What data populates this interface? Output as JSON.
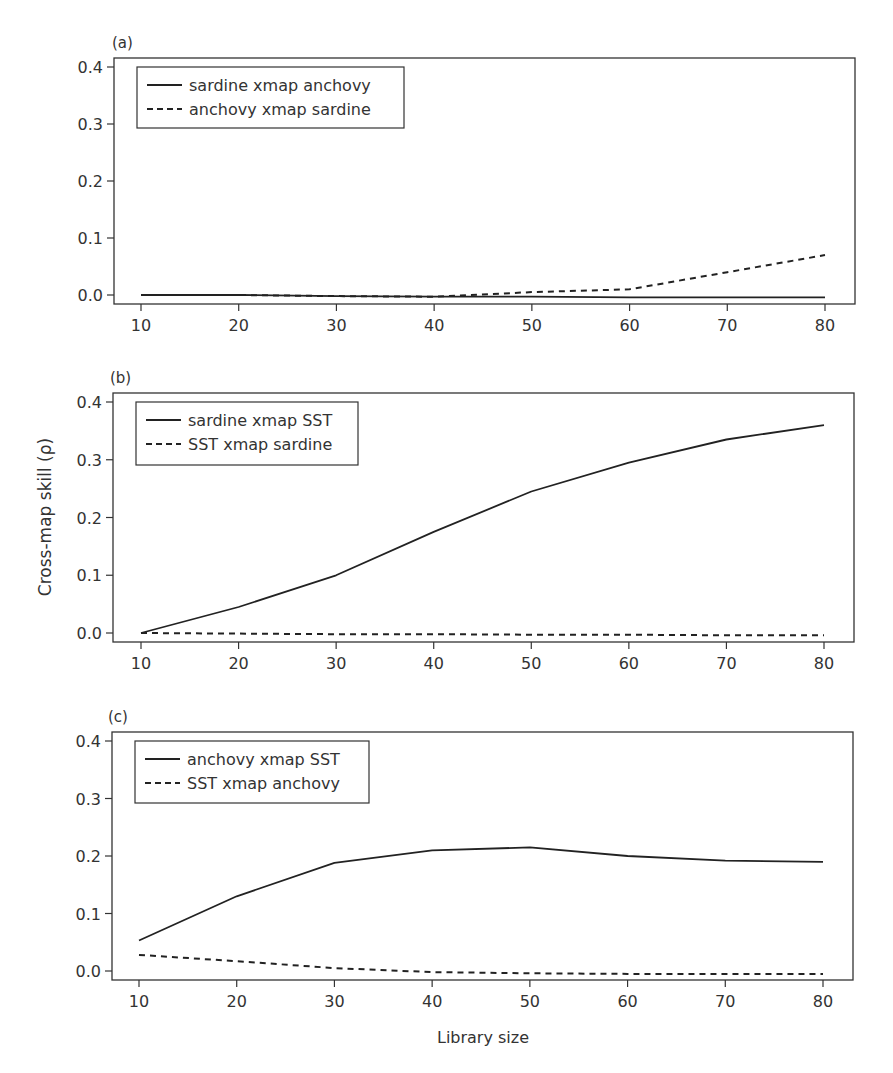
{
  "figure": {
    "ylabel": "Cross-map skill (ρ)",
    "xlabel": "Library size"
  },
  "chart_data": [
    {
      "type": "line",
      "panel_label": "(a)",
      "xlabel": "",
      "ylabel": "",
      "xlim": [
        10,
        80
      ],
      "ylim": [
        0.0,
        0.4
      ],
      "x_ticks": [
        "10",
        "20",
        "30",
        "40",
        "50",
        "60",
        "70",
        "80"
      ],
      "y_ticks": [
        "0.0",
        "0.1",
        "0.2",
        "0.3",
        "0.4"
      ],
      "grid": false,
      "legend_position": "upper-left",
      "x": [
        10,
        20,
        30,
        40,
        50,
        60,
        70,
        80
      ],
      "series": [
        {
          "name": "sardine xmap anchovy",
          "style": "solid",
          "values": [
            0.0,
            0.0,
            -0.002,
            -0.003,
            -0.003,
            -0.004,
            -0.004,
            -0.004
          ]
        },
        {
          "name": "anchovy xmap sardine",
          "style": "dashed",
          "values": [
            0.0,
            0.0,
            -0.002,
            -0.003,
            0.005,
            0.01,
            0.04,
            0.07
          ]
        }
      ]
    },
    {
      "type": "line",
      "panel_label": "(b)",
      "xlabel": "",
      "ylabel": "Cross-map skill (ρ)",
      "xlim": [
        10,
        80
      ],
      "ylim": [
        0.0,
        0.4
      ],
      "x_ticks": [
        "10",
        "20",
        "30",
        "40",
        "50",
        "60",
        "70",
        "80"
      ],
      "y_ticks": [
        "0.0",
        "0.1",
        "0.2",
        "0.3",
        "0.4"
      ],
      "grid": false,
      "legend_position": "upper-left",
      "x": [
        10,
        20,
        30,
        40,
        50,
        60,
        70,
        80
      ],
      "series": [
        {
          "name": "sardine xmap SST",
          "style": "solid",
          "values": [
            0.0,
            0.045,
            0.1,
            0.175,
            0.245,
            0.295,
            0.335,
            0.36
          ]
        },
        {
          "name": "SST xmap sardine",
          "style": "dashed",
          "values": [
            0.0,
            -0.001,
            -0.002,
            -0.002,
            -0.003,
            -0.003,
            -0.004,
            -0.004
          ]
        }
      ]
    },
    {
      "type": "line",
      "panel_label": "(c)",
      "xlabel": "Library size",
      "ylabel": "",
      "xlim": [
        10,
        80
      ],
      "ylim": [
        0.0,
        0.4
      ],
      "x_ticks": [
        "10",
        "20",
        "30",
        "40",
        "50",
        "60",
        "70",
        "80"
      ],
      "y_ticks": [
        "0.0",
        "0.1",
        "0.2",
        "0.3",
        "0.4"
      ],
      "grid": false,
      "legend_position": "upper-left",
      "x": [
        10,
        20,
        30,
        40,
        50,
        60,
        70,
        80
      ],
      "series": [
        {
          "name": "anchovy xmap SST",
          "style": "solid",
          "values": [
            0.053,
            0.13,
            0.188,
            0.21,
            0.215,
            0.2,
            0.192,
            0.19
          ]
        },
        {
          "name": "SST xmap anchovy",
          "style": "dashed",
          "values": [
            0.028,
            0.017,
            0.005,
            -0.002,
            -0.004,
            -0.005,
            -0.005,
            -0.005
          ]
        }
      ]
    }
  ],
  "layout": {
    "panels": [
      {
        "box": [
          114,
          58,
          855,
          304
        ],
        "y0_px": 295,
        "y04_px": 67,
        "x10_px": 141,
        "x80_px": 825,
        "label_pos": [
          112,
          48
        ],
        "legend": [
          137,
          67,
          404,
          128
        ]
      },
      {
        "box": [
          113,
          393,
          854,
          642
        ],
        "y0_px": 633,
        "y04_px": 402,
        "x10_px": 141,
        "x80_px": 824,
        "label_pos": [
          110,
          383
        ],
        "legend": [
          136,
          402,
          358,
          465
        ]
      },
      {
        "box": [
          112,
          732,
          853,
          980
        ],
        "y0_px": 971,
        "y04_px": 741,
        "x10_px": 139,
        "x80_px": 823,
        "label_pos": [
          108,
          722
        ],
        "legend": [
          135,
          741,
          369,
          803
        ]
      }
    ],
    "line_color": "#222222",
    "axis_color": "#333333"
  }
}
